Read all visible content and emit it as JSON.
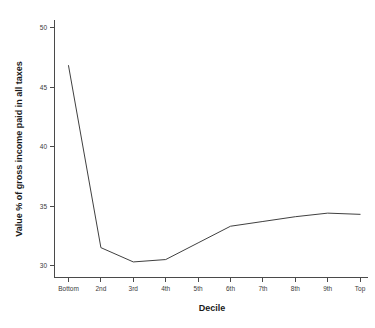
{
  "chart_data": {
    "type": "line",
    "title": "",
    "subtitle": "",
    "xlabel": "Decile",
    "ylabel": "Value % of gross income paid in all taxes",
    "categories": [
      "Bottom",
      "2nd",
      "3rd",
      "4th",
      "5th",
      "6th",
      "7th",
      "8th",
      "9th",
      "Top"
    ],
    "series": [
      {
        "name": "Value % of gross income paid in all taxes",
        "values": [
          46.8,
          31.5,
          30.3,
          30.5,
          31.9,
          33.3,
          33.7,
          34.1,
          34.4,
          34.3
        ],
        "color": "#404040"
      }
    ],
    "ylim": [
      28.8,
      50.8
    ],
    "xlim": [
      0,
      9
    ],
    "yticks": [
      30,
      35,
      40,
      45,
      50
    ],
    "ytick_labels": [
      "30",
      "35",
      "40",
      "45",
      "50"
    ],
    "xtick_labels": [
      "Bottom",
      "2nd",
      "3rd",
      "4th",
      "5th",
      "6th",
      "7th",
      "8th",
      "9th",
      "Top"
    ],
    "grid": false,
    "legend": false,
    "legend_position": "none",
    "annotations": []
  },
  "axes": {
    "y_axis_title": "Value % of gross income paid in all taxes",
    "x_axis_title": "Decile"
  },
  "colors": {
    "line": "#404040",
    "axis": "#4a4a4a",
    "text": "#1a1a1a",
    "tick_text": "#3a3a3a",
    "background": "#ffffff"
  }
}
